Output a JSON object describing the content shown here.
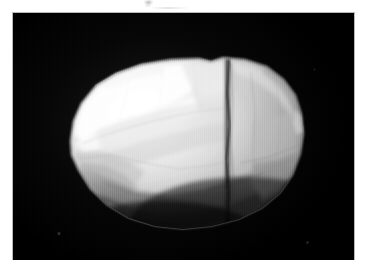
{
  "figure": {
    "kind": "grayscale-shape-model-render",
    "background_color": "#000000",
    "page_color": "#ffffff",
    "frame": {
      "left": 13,
      "top": 13,
      "width": 341,
      "height": 247
    },
    "caption": "",
    "title": ""
  },
  "render": {
    "illumination_direction": "upper-left",
    "terminator": "lower-right",
    "surface_type": "faceted-polygonal",
    "highlight_color": "#fdfdfd",
    "midtone_color": "#c8c8c8",
    "shadow_color": "#6b6b6b",
    "deep_shadow_color": "#2a2a2a",
    "crease_color": "#4a4a4a",
    "body_bounds": {
      "left": 57,
      "top": 47,
      "width": 234,
      "height": 170
    },
    "features": [
      {
        "name": "bright-left-lobe",
        "tone": "#fafafa"
      },
      {
        "name": "central-ridge",
        "tone": "#d6d6d6"
      },
      {
        "name": "vertical-crease",
        "tone": "#3f3f3f"
      },
      {
        "name": "right-lobe",
        "tone": "#b4b4b4"
      },
      {
        "name": "lower-shadowed-flank",
        "tone": "#7a7a7a"
      },
      {
        "name": "limb-highlight",
        "tone": "#e8e8e8"
      }
    ]
  },
  "artifacts": {
    "top_smudge": {
      "x": 144,
      "y": 0,
      "width": 9,
      "height": 6
    },
    "scan_band": {
      "x": 150,
      "y": 7,
      "width": 40,
      "height": 2
    },
    "specks": [
      {
        "name": "speck-lowerleft",
        "x": 57,
        "y": 231
      },
      {
        "name": "speck-lowerright",
        "x": 305,
        "y": 241
      },
      {
        "name": "speck-upperright",
        "x": 313,
        "y": 68
      }
    ]
  }
}
